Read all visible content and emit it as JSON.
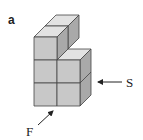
{
  "figure": {
    "panel_label": "a",
    "colors": {
      "front": "#c8c8c8",
      "top": "#e2e2e2",
      "side": "#a9a9a9",
      "edge": "#444444",
      "arrow": "#222222"
    },
    "arrows": [
      {
        "label": "S",
        "meaning": "side view direction"
      },
      {
        "label": "F",
        "meaning": "front view direction"
      }
    ]
  }
}
